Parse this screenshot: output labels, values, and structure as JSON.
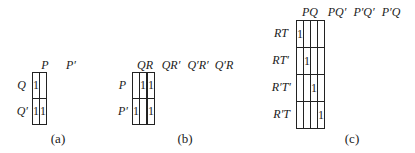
{
  "maps": [
    {
      "id": "a",
      "caption": "(a)",
      "col_labels": [
        "P",
        "P′"
      ],
      "row_labels": [
        "Q",
        "Q′"
      ],
      "cells": [
        [
          "1",
          ""
        ],
        [
          "1",
          "1"
        ]
      ]
    },
    {
      "id": "b",
      "caption": "(b)",
      "col_labels": [
        "QR",
        "QR′",
        "Q′R′",
        "Q′R"
      ],
      "row_labels": [
        "P",
        "P′"
      ],
      "cells": [
        [
          "",
          "1",
          "",
          "1"
        ],
        [
          "1",
          "",
          "",
          "1"
        ]
      ]
    },
    {
      "id": "c",
      "caption": "(c)",
      "col_labels": [
        "PQ",
        "PQ′",
        "P′Q′",
        "P′Q"
      ],
      "row_labels": [
        "RT",
        "RT′",
        "R′T′",
        "R′T"
      ],
      "cells": [
        [
          "1",
          "",
          "",
          ""
        ],
        [
          "",
          "1",
          "",
          ""
        ],
        [
          "",
          "",
          "1",
          ""
        ],
        [
          "",
          "",
          "",
          "1"
        ]
      ]
    }
  ]
}
